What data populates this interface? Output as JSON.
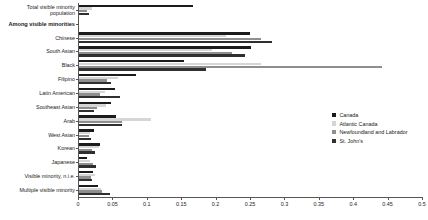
{
  "chart_data": {
    "type": "bar",
    "orientation": "horizontal",
    "title": "",
    "xlabel": "",
    "ylabel": "",
    "xlim": [
      0,
      0.5
    ],
    "grid": false,
    "legend_position": "right",
    "xticks": [
      "0",
      "0.05",
      "0.1",
      "0.15",
      "0.2",
      "0.25",
      "0.3",
      "0.35",
      "0.4",
      "0.45",
      "0.5"
    ],
    "xtick_values": [
      0,
      0.05,
      0.1,
      0.15,
      0.2,
      0.25,
      0.3,
      0.35,
      0.4,
      0.45,
      0.5
    ],
    "categories": [
      "Total visible minority population",
      "Among visible minorities",
      "Chinese",
      "South Asian",
      "Black",
      "Filipino",
      "Latin American",
      "Southeast Asian",
      "Arab",
      "West Asian",
      "Korean",
      "Japanese",
      "Visible minority, n.i.e.",
      "Multiple visible minority"
    ],
    "category_styles": [
      "normal",
      "bold",
      "normal",
      "normal",
      "normal",
      "normal",
      "normal",
      "normal",
      "normal",
      "normal",
      "normal",
      "normal",
      "normal",
      "normal"
    ],
    "series": [
      {
        "name": "Canada",
        "color": "#1b1b1b",
        "values": [
          0.165,
          null,
          0.248,
          0.25,
          0.152,
          0.083,
          0.052,
          0.046,
          0.054,
          0.022,
          0.03,
          0.012,
          0.02,
          0.027
        ]
      },
      {
        "name": "Atlantic Canada",
        "color": "#d6d6d6",
        "values": [
          0.019,
          null,
          0.214,
          0.193,
          0.265,
          0.057,
          0.038,
          0.039,
          0.105,
          0.016,
          0.029,
          0.016,
          0.023,
          0.032
        ]
      },
      {
        "name": "Newfoundland and Labrador",
        "color": "#8f8f8f",
        "values": [
          0.011,
          null,
          0.265,
          0.223,
          0.44,
          0.04,
          0.03,
          0.026,
          0.063,
          0.014,
          0.019,
          0.021,
          0.017,
          0.034
        ]
      },
      {
        "name": "St. John's",
        "color": "#2f2f2f",
        "values": [
          0.015,
          null,
          0.28,
          0.242,
          0.184,
          0.046,
          0.06,
          0.022,
          0.062,
          0.017,
          0.023,
          0.025,
          0.019,
          0.045
        ]
      }
    ]
  },
  "legend": {
    "items": [
      {
        "label": "Canada",
        "swatch": "s0"
      },
      {
        "label": "Atlantic Canada",
        "swatch": "s1"
      },
      {
        "label": "Newfoundland and Labrador",
        "swatch": "s2"
      },
      {
        "label": "St. John's",
        "swatch": "s3"
      }
    ]
  }
}
